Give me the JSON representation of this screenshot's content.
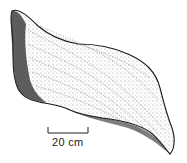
{
  "figure": {
    "scale_bar": {
      "label": "20 cm"
    },
    "colors": {
      "ink": "#1a1a1a",
      "background": "#ffffff"
    }
  }
}
